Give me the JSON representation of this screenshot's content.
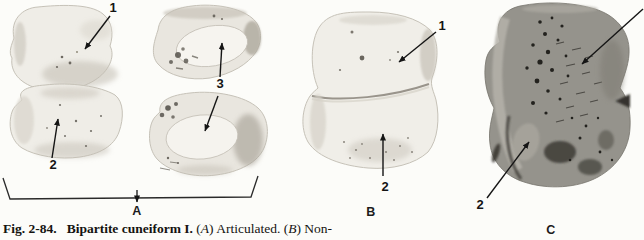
{
  "figure": {
    "caption": {
      "fig_label": "Fig. 2-84.",
      "title": "Bipartite cuneiform I.",
      "seg_a_open": "(",
      "seg_a_letter": "A",
      "seg_a_text": ") Articulated. (",
      "seg_b_letter": "B",
      "seg_b_text": ") Non-"
    },
    "panels": {
      "a": {
        "letter": "A",
        "callouts": {
          "c1": "1",
          "c2": "2",
          "c3": "3"
        }
      },
      "b": {
        "letter": "B",
        "callouts": {
          "c1": "1",
          "c2": "2"
        }
      },
      "c": {
        "letter": "C",
        "callouts": {
          "c2": "2"
        }
      }
    },
    "colors": {
      "background": "#fcfcf9",
      "bone_light": "#efede7",
      "bone_light_edge": "#c6c2b8",
      "bone_dark": "#95938c",
      "ink": "#151515"
    }
  }
}
